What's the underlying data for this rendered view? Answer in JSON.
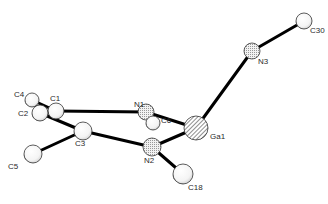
{
  "figure": {
    "type": "ORTEP molecular structure",
    "atoms": [
      {
        "id": "Ga1",
        "label": "Ga1",
        "element": "Ga",
        "style": "hatched"
      },
      {
        "id": "N1",
        "label": "N1",
        "element": "N",
        "style": "dotted"
      },
      {
        "id": "N2",
        "label": "N2",
        "element": "N",
        "style": "dotted"
      },
      {
        "id": "N3",
        "label": "N3",
        "element": "N",
        "style": "dotted"
      },
      {
        "id": "C1",
        "label": "C1",
        "element": "C",
        "style": "shaded"
      },
      {
        "id": "C2",
        "label": "C2",
        "element": "C",
        "style": "shaded"
      },
      {
        "id": "C3",
        "label": "C3",
        "element": "C",
        "style": "shaded"
      },
      {
        "id": "C4",
        "label": "C4",
        "element": "C",
        "style": "shaded"
      },
      {
        "id": "C5",
        "label": "C5",
        "element": "C",
        "style": "shaded"
      },
      {
        "id": "C6",
        "label": "C6",
        "element": "C",
        "style": "shaded"
      },
      {
        "id": "C18",
        "label": "C18",
        "element": "C",
        "style": "shaded"
      },
      {
        "id": "C30",
        "label": "C30",
        "element": "C",
        "style": "shaded"
      }
    ],
    "bonds": [
      [
        "C4",
        "C1"
      ],
      [
        "C4",
        "C2"
      ],
      [
        "C2",
        "C1"
      ],
      [
        "C2",
        "C3"
      ],
      [
        "C1",
        "N1"
      ],
      [
        "C3",
        "N2"
      ],
      [
        "C3",
        "C5"
      ],
      [
        "N1",
        "Ga1"
      ],
      [
        "N2",
        "Ga1"
      ],
      [
        "N2",
        "C18"
      ],
      [
        "N1",
        "C6"
      ],
      [
        "Ga1",
        "N3"
      ],
      [
        "N3",
        "C30"
      ]
    ]
  }
}
